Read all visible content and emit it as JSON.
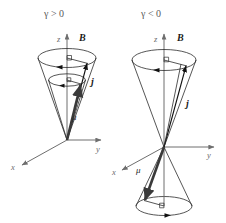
{
  "figure": {
    "type": "physics-diagram",
    "background_color": "#ffffff"
  },
  "panels": [
    {
      "id": "left",
      "title": "γ > 0",
      "title_color": "#5a5a5a",
      "axes": [
        {
          "name": "z-axis",
          "label": "z",
          "direction": "up"
        },
        {
          "name": "y-axis",
          "label": "y",
          "direction": "right"
        },
        {
          "name": "x-axis",
          "label": "x",
          "direction": "down-left"
        }
      ],
      "field_label": "B",
      "vectors": [
        {
          "name": "angular-momentum",
          "label": "j",
          "direction": "up-right",
          "style": "bold-italic"
        },
        {
          "name": "magnetic-moment",
          "label": "μ",
          "direction": "up-right",
          "style": "italic"
        }
      ],
      "cones": 2,
      "precession_circles": 2,
      "precession_sense": "counterclockwise-viewed-from-above",
      "description": "Two nested upward cones; j and μ both point upward and are parallel"
    },
    {
      "id": "right",
      "title": "γ < 0",
      "title_color": "#5a5a5a",
      "axes": [
        {
          "name": "z-axis",
          "label": "z",
          "direction": "up"
        },
        {
          "name": "y-axis",
          "label": "y",
          "direction": "right"
        },
        {
          "name": "x-axis",
          "label": "x",
          "direction": "down-left"
        }
      ],
      "field_label": "B",
      "vectors": [
        {
          "name": "angular-momentum",
          "label": "j",
          "direction": "up-right",
          "style": "bold-italic"
        },
        {
          "name": "magnetic-moment",
          "label": "μ",
          "direction": "down-left",
          "style": "italic"
        }
      ],
      "cones": 2,
      "precession_circles": 2,
      "precession_sense": "counterclockwise-viewed-from-above",
      "description": "Upper cone and inverted lower cone; j points up while μ points down, antiparallel"
    }
  ],
  "colors": {
    "axis": "#6e6e6e",
    "cone": "#2b2b2b",
    "vector": "#111111",
    "moment_vector": "#3a3a3a",
    "title_text": "#5a5a5a",
    "label_text": "#1a1a1a"
  }
}
